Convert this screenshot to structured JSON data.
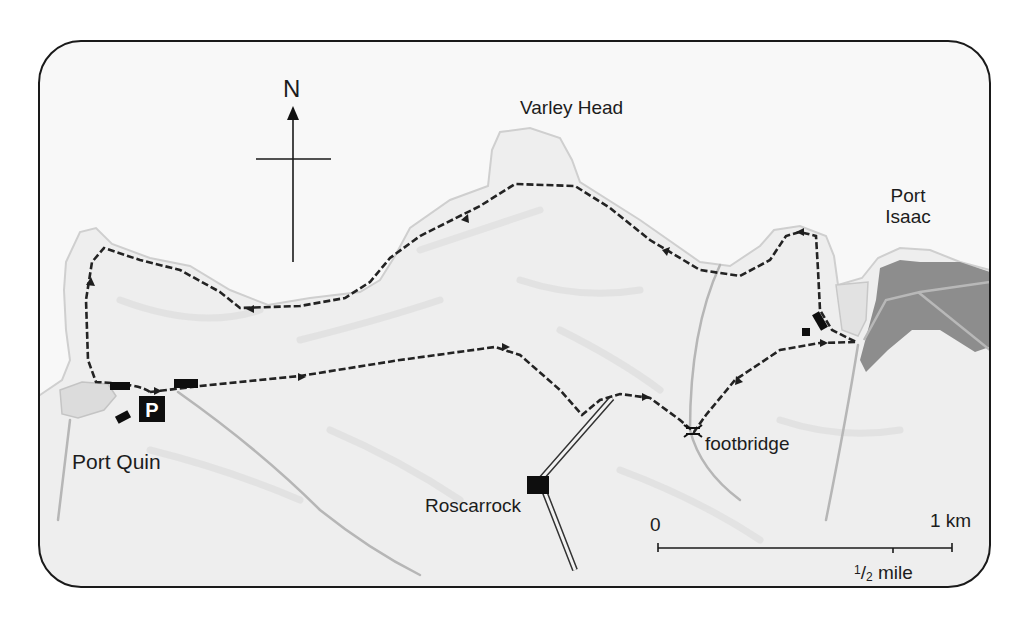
{
  "map": {
    "title": "Port Quin to Port Isaac walk",
    "north_label": "N",
    "places": {
      "varley_head": "Varley Head",
      "port_isaac_line1": "Port",
      "port_isaac_line2": "Isaac",
      "port_quin": "Port Quin",
      "roscarrock": "Roscarrock",
      "footbridge": "footbridge"
    },
    "parking_label": "P",
    "scale": {
      "start": "0",
      "end": "1 km",
      "half_mile_num": "1",
      "half_mile_slash": "/",
      "half_mile_den": "2",
      "half_mile_unit": " mile"
    },
    "colors": {
      "frame": "#1a1a1a",
      "land": "#efefef",
      "sea": "#f9f9f9",
      "route": "#2a2a2a",
      "village": "#8a8a8a",
      "stream": "#b4b4b4"
    },
    "icons": [
      "north-arrow-icon",
      "parking-icon",
      "building-icon",
      "footbridge-icon",
      "route-direction-arrow-icon"
    ]
  }
}
